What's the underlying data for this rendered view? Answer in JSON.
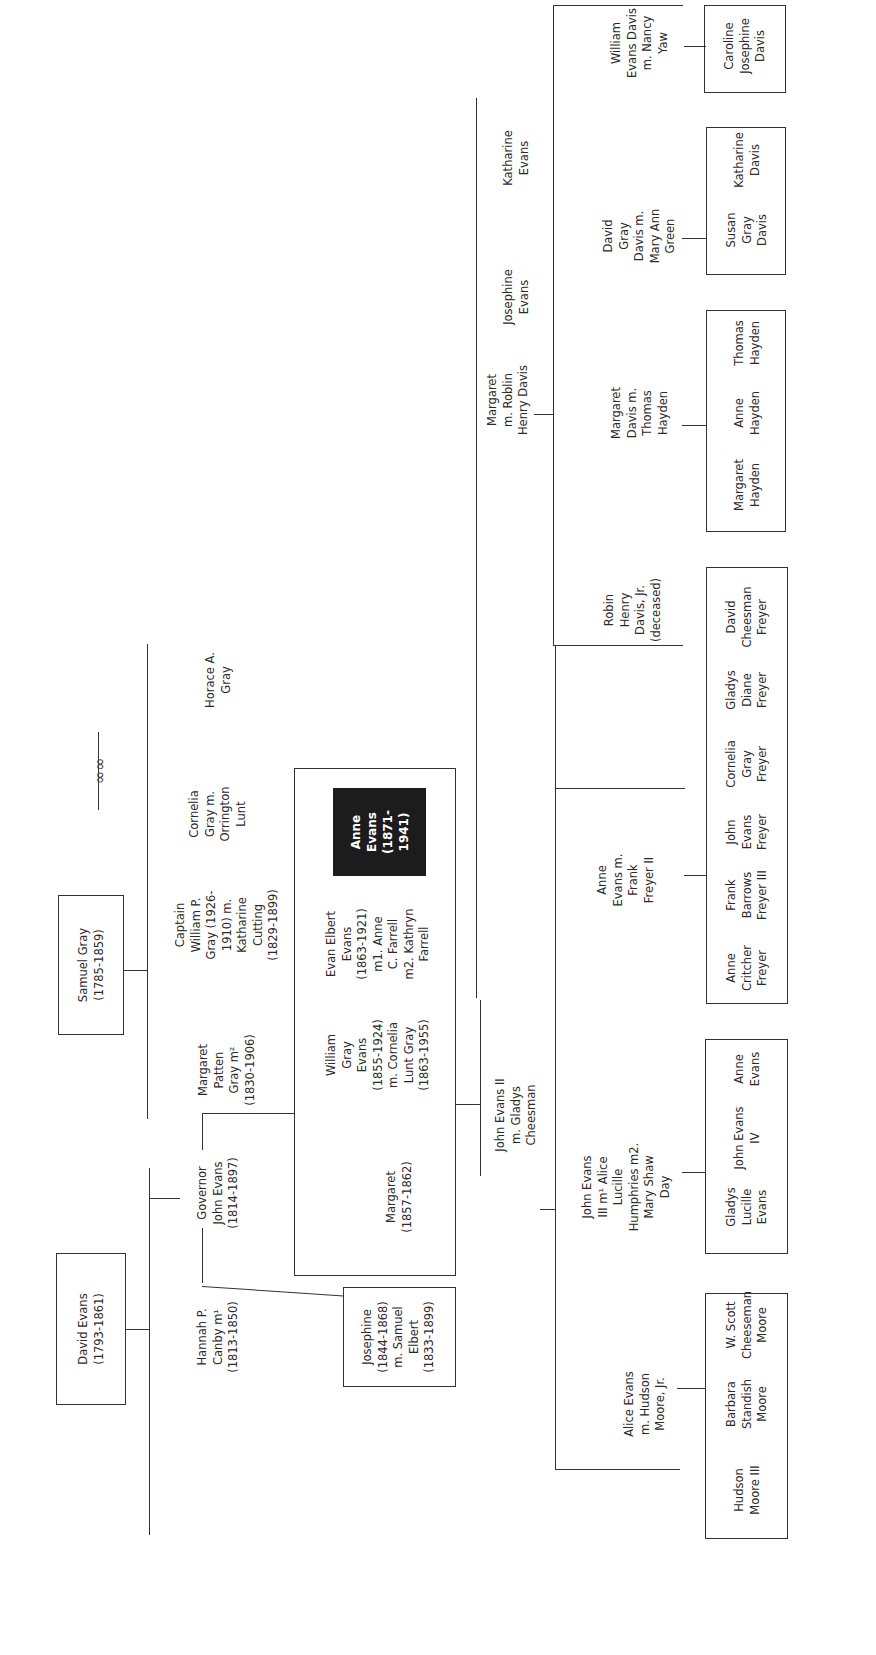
{
  "title_ornament": "knot-ornament",
  "people": {
    "david_evans": "David Evans\n(1793-1861)",
    "samuel_gray": "Samuel Gray\n(1785-1859)",
    "hannah_canby": "Hannah P.\nCanby m¹\n(1813-1850)",
    "governor_john_evans": "Governor\nJohn Evans\n(1814-1897)",
    "margaret_patten_gray": "Margaret\nPatten\nGray m²\n(1830-1906)",
    "captain_william_gray": "Captain\nWilliam P.\nGray (1926-\n1910) m.\nKatharine\nCutting\n(1829-1899)",
    "cornelia_gray": "Cornelia\nGray m.\nOrrington\nLunt",
    "horace_gray": "Horace A.\nGray",
    "josephine_evans_elbert": "Josephine\n(1844-1868)\nm. Samuel\nElbert\n(1833-1899)",
    "margaret_1857": "Margaret\n(1857-1862)",
    "william_gray_evans": "William\nGray\nEvans\n(1855-1924)\nm. Cornelia\nLunt Gray\n(1863-1955)",
    "evan_elbert_evans": "Evan Elbert\nEvans\n(1863-1921)\nm1. Anne\nC. Farrell\nm2. Kathryn\nFarrell",
    "anne_evans": "Anne\nEvans\n(1871-\n1941)",
    "john_evans_ii": "John Evans II\nm. Gladys\nCheesman",
    "alice_evans": "Alice Evans\nm. Hudson\nMoore, Jr.",
    "john_evans_iii": "John Evans\nIII m¹ Alice\nLucille\nHumphries m2.\nMary Shaw\nDay",
    "anne_evans_freyer": "Anne\nEvans m.\nFrank\nFreyer II",
    "margaret_davis": "Margaret\nm. Roblin\nHenry Davis",
    "josephine_evans": "Josephine\nEvans",
    "katharine_evans": "Katharine\nEvans",
    "robin_davis_jr": "Robin\nHenry\nDavis, Jr.\n(deceased)",
    "margaret_davis_hayden": "Margaret\nDavis m.\nThomas\nHayden",
    "david_gray_davis": "David\nGray\nDavis m.\nMary Ann\nGreen",
    "william_evans_davis": "William\nEvans Davis\nm. Nancy\nYaw"
  },
  "grandchildren_groups": {
    "moore": [
      "Hudson\nMoore III",
      "Barbara\nStandish\nMoore",
      "W. Scott\nCheeseman\nMoore"
    ],
    "evans": [
      "Gladys\nLucille\nEvans",
      "John Evans\nIV",
      "Anne\nEvans"
    ],
    "freyer": [
      "Anne\nCritcher\nFreyer",
      "Frank\nBarrows\nFreyer III",
      "John\nEvans\nFreyer",
      "Cornelia\nGray\nFreyer",
      "Gladys\nDiane\nFreyer",
      "David\nCheesman\nFreyer"
    ],
    "hayden": [
      "Margaret\nHayden",
      "Anne\nHayden",
      "Thomas\nHayden"
    ],
    "green_davis": [
      "Susan\nGray\nDavis",
      "Katharine\nDavis"
    ],
    "yaw_davis": [
      "Caroline\nJosephine\nDavis"
    ]
  },
  "colors": {
    "line": "#333333",
    "highlight_bg": "#1c1c1c",
    "highlight_text": "#ffffff"
  }
}
